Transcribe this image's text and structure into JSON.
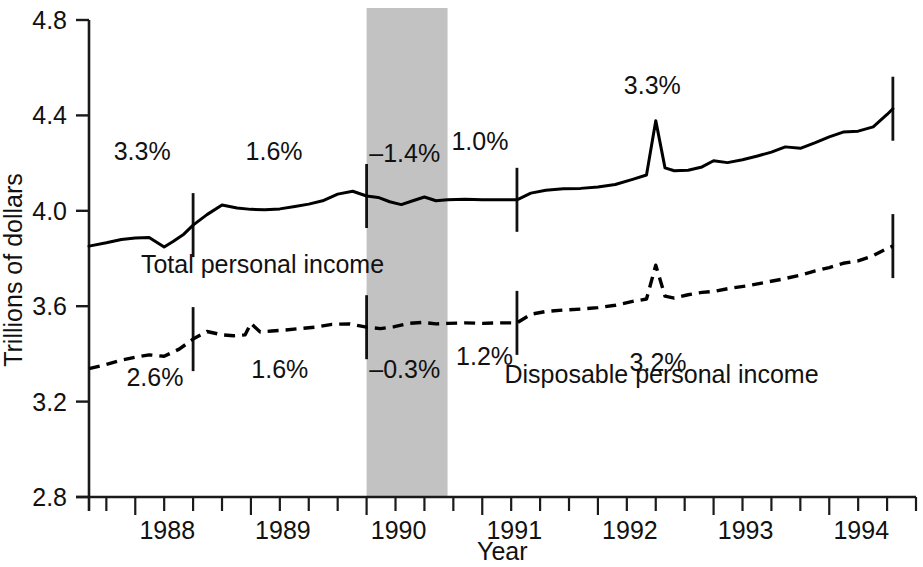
{
  "chart_data": {
    "type": "line",
    "title": "",
    "xlabel": "Year",
    "ylabel": "Trillions of dollars",
    "xlim": [
      1987.6,
      1994.75
    ],
    "ylim": [
      2.8,
      4.8
    ],
    "grid": false,
    "legend_position": "inline-annotation",
    "y_ticks": [
      "2.8",
      "3.2",
      "3.6",
      "4.0",
      "4.4",
      "4.8"
    ],
    "y_tick_values": [
      2.8,
      3.2,
      3.6,
      4.0,
      4.4,
      4.8
    ],
    "x_ticks": [
      "1988",
      "1989",
      "1990",
      "1991",
      "1992",
      "1993",
      "1994"
    ],
    "x_tick_values": [
      1988,
      1989,
      1990,
      1991,
      1992,
      1993,
      1994
    ],
    "x_minor_interval": 0.25,
    "shaded_region": {
      "label": "recession",
      "start": 1990.0,
      "end": 1990.7,
      "color": "#c2c2c2"
    },
    "segment_dividers": [
      1988.5,
      1990.0,
      1990.7,
      1991.3,
      1994.55
    ],
    "series": [
      {
        "name": "Total personal income",
        "style": "solid",
        "label_x": 1989.1,
        "label_y": 3.74,
        "x": [
          1987.6,
          1987.75,
          1987.88,
          1988.0,
          1988.12,
          1988.25,
          1988.33,
          1988.42,
          1988.5,
          1988.62,
          1988.75,
          1988.88,
          1989.0,
          1989.12,
          1989.25,
          1989.38,
          1989.5,
          1989.62,
          1989.75,
          1989.88,
          1990.0,
          1990.1,
          1990.2,
          1990.3,
          1990.4,
          1990.5,
          1990.6,
          1990.7,
          1990.85,
          1991.0,
          1991.15,
          1991.3,
          1991.42,
          1991.55,
          1991.7,
          1991.85,
          1992.0,
          1992.15,
          1992.3,
          1992.42,
          1992.5,
          1992.58,
          1992.66,
          1992.78,
          1992.9,
          1993.0,
          1993.12,
          1993.25,
          1993.38,
          1993.5,
          1993.62,
          1993.75,
          1993.88,
          1994.0,
          1994.12,
          1994.25,
          1994.38,
          1994.5,
          1994.55
        ],
        "y": [
          3.852,
          3.866,
          3.88,
          3.886,
          3.888,
          3.848,
          3.872,
          3.902,
          3.94,
          3.984,
          4.024,
          4.012,
          4.006,
          4.004,
          4.008,
          4.018,
          4.028,
          4.042,
          4.07,
          4.082,
          4.062,
          4.056,
          4.038,
          4.026,
          4.042,
          4.058,
          4.042,
          4.046,
          4.048,
          4.046,
          4.046,
          4.046,
          4.074,
          4.086,
          4.092,
          4.094,
          4.1,
          4.11,
          4.132,
          4.15,
          4.378,
          4.18,
          4.168,
          4.17,
          4.184,
          4.21,
          4.202,
          4.214,
          4.23,
          4.246,
          4.268,
          4.262,
          4.286,
          4.31,
          4.33,
          4.334,
          4.352,
          4.404,
          4.428
        ]
      },
      {
        "name": "Disposable personal income",
        "style": "dashed",
        "label_x": 1992.55,
        "label_y": 3.28,
        "x": [
          1987.6,
          1987.75,
          1987.88,
          1988.0,
          1988.12,
          1988.25,
          1988.38,
          1988.5,
          1988.62,
          1988.75,
          1988.85,
          1988.95,
          1989.0,
          1989.08,
          1989.18,
          1989.3,
          1989.42,
          1989.55,
          1989.7,
          1989.85,
          1990.0,
          1990.12,
          1990.24,
          1990.36,
          1990.48,
          1990.6,
          1990.7,
          1990.85,
          1991.0,
          1991.15,
          1991.3,
          1991.42,
          1991.55,
          1991.7,
          1991.85,
          1992.0,
          1992.15,
          1992.3,
          1992.42,
          1992.5,
          1992.58,
          1992.66,
          1992.78,
          1992.9,
          1993.0,
          1993.15,
          1993.3,
          1993.45,
          1993.6,
          1993.75,
          1993.88,
          1994.0,
          1994.12,
          1994.25,
          1994.38,
          1994.5,
          1994.55
        ],
        "y": [
          3.338,
          3.356,
          3.374,
          3.386,
          3.396,
          3.39,
          3.42,
          3.462,
          3.494,
          3.48,
          3.476,
          3.48,
          3.528,
          3.492,
          3.496,
          3.5,
          3.506,
          3.512,
          3.524,
          3.526,
          3.512,
          3.506,
          3.514,
          3.528,
          3.532,
          3.526,
          3.528,
          3.53,
          3.528,
          3.53,
          3.53,
          3.566,
          3.578,
          3.584,
          3.588,
          3.594,
          3.604,
          3.62,
          3.63,
          3.772,
          3.642,
          3.634,
          3.648,
          3.658,
          3.662,
          3.676,
          3.686,
          3.7,
          3.714,
          3.73,
          3.748,
          3.762,
          3.78,
          3.79,
          3.812,
          3.842,
          3.852
        ]
      }
    ],
    "annotations": [
      {
        "text": "3.3%",
        "x": 1988.06,
        "y": 4.215,
        "series": "Total personal income",
        "period": "1987.6-1988.5"
      },
      {
        "text": "1.6%",
        "x": 1989.2,
        "y": 4.215,
        "series": "Total personal income",
        "period": "1988.5-1990.0"
      },
      {
        "text": "–1.4%",
        "x": 1990.33,
        "y": 4.205,
        "series": "Total personal income",
        "period": "1990.0-1990.7"
      },
      {
        "text": "1.0%",
        "x": 1990.98,
        "y": 4.255,
        "series": "Total personal income",
        "period": "1990.7-1991.3"
      },
      {
        "text": "3.3%",
        "x": 1992.47,
        "y": 4.49,
        "series": "Total personal income",
        "period": "1991.3-1994.55"
      },
      {
        "text": "2.6%",
        "x": 1988.17,
        "y": 3.265,
        "series": "Disposable personal income",
        "period": "1987.6-1988.5"
      },
      {
        "text": "1.6%",
        "x": 1989.25,
        "y": 3.3,
        "series": "Disposable personal income",
        "period": "1988.5-1990.0"
      },
      {
        "text": "–0.3%",
        "x": 1990.33,
        "y": 3.3,
        "series": "Disposable personal income",
        "period": "1990.0-1990.7"
      },
      {
        "text": "1.2%",
        "x": 1991.02,
        "y": 3.352,
        "series": "Disposable personal income",
        "period": "1990.7-1991.3"
      },
      {
        "text": "3.2%",
        "x": 1992.52,
        "y": 3.33,
        "series": "Disposable personal income",
        "period": "1991.3-1994.55"
      }
    ]
  }
}
